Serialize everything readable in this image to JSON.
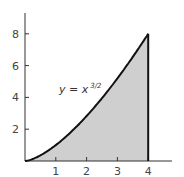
{
  "chart_data": {
    "type": "area",
    "title": "",
    "xlabel": "",
    "ylabel": "",
    "function": "y = x^(3/2)",
    "x": [
      0,
      0.5,
      1,
      1.5,
      2,
      2.5,
      3,
      3.5,
      4
    ],
    "y": [
      0,
      0.354,
      1,
      1.837,
      2.828,
      3.953,
      5.196,
      6.548,
      8
    ],
    "shaded_region": {
      "x_from": 0,
      "x_to": 4
    },
    "xlim": [
      0,
      4.7
    ],
    "ylim": [
      0,
      9.2
    ],
    "xticks": [
      "1",
      "2",
      "3",
      "4"
    ],
    "yticks": [
      "2",
      "4",
      "6",
      "8"
    ],
    "grid": false,
    "annotation": {
      "text": "y = x",
      "superscript": "3/2"
    },
    "colors": {
      "curve": "#111111",
      "fill": "#cfcfcf",
      "axis": "#333333"
    }
  }
}
